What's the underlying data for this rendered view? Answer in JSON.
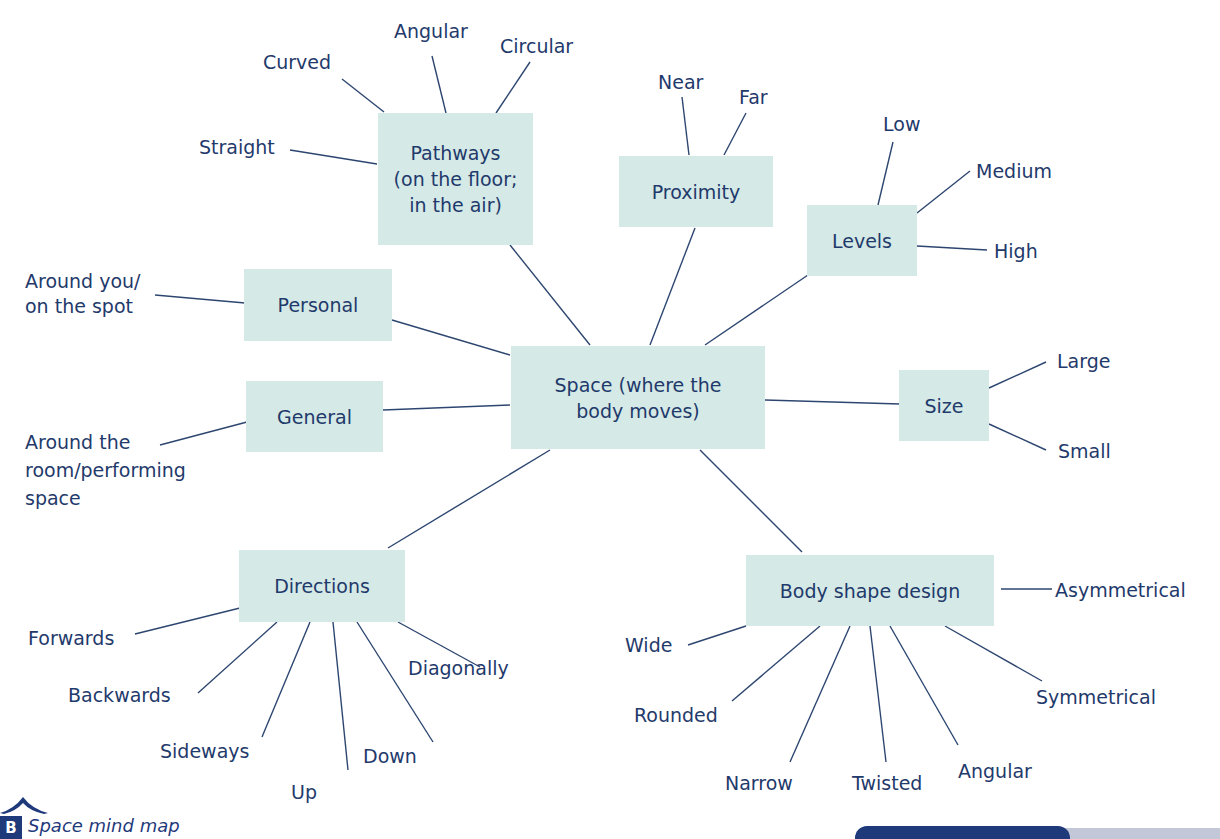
{
  "diagram": {
    "type": "mind_map",
    "colors": {
      "box_fill": "#d5e9e6",
      "text": "#1f3a6b",
      "line": "#2d4670",
      "caption": "#1f3a7b"
    },
    "center": {
      "label_line1": "Space (where the",
      "label_line2": "body moves)"
    },
    "branches": {
      "pathways": {
        "label_line1": "Pathways",
        "label_line2": "(on the floor;",
        "label_line3": "in the air)",
        "leaves": [
          "Curved",
          "Angular",
          "Circular",
          "Straight"
        ]
      },
      "proximity": {
        "label": "Proximity",
        "leaves": [
          "Near",
          "Far"
        ]
      },
      "levels": {
        "label": "Levels",
        "leaves": [
          "Low",
          "Medium",
          "High"
        ]
      },
      "personal": {
        "label": "Personal",
        "leaves_line1": "Around you/",
        "leaves_line2": "on the spot"
      },
      "general": {
        "label": "General",
        "leaf_line1": "Around the",
        "leaf_line2": "room/performing",
        "leaf_line3": "space"
      },
      "size": {
        "label": "Size",
        "leaves": [
          "Large",
          "Small"
        ]
      },
      "directions": {
        "label": "Directions",
        "leaves": [
          "Forwards",
          "Backwards",
          "Sideways",
          "Up",
          "Down",
          "Diagonally"
        ]
      },
      "body_shape": {
        "label": "Body shape design",
        "leaves": [
          "Asymmetrical",
          "Wide",
          "Rounded",
          "Narrow",
          "Twisted",
          "Angular",
          "Symmetrical"
        ]
      }
    }
  },
  "caption": {
    "badge": "B",
    "text": "Space mind map"
  }
}
